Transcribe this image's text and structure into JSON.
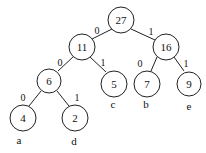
{
  "diagram": {
    "type": "huffman-tree",
    "nodes": [
      {
        "id": "n27",
        "value": "27",
        "x": 121,
        "y": 20
      },
      {
        "id": "n11",
        "value": "11",
        "x": 82,
        "y": 47
      },
      {
        "id": "n16",
        "value": "16",
        "x": 166,
        "y": 47
      },
      {
        "id": "n6",
        "value": "6",
        "x": 49,
        "y": 81
      },
      {
        "id": "n5",
        "value": "5",
        "x": 114,
        "y": 83,
        "leaf_label": "c"
      },
      {
        "id": "n7",
        "value": "7",
        "x": 147,
        "y": 83,
        "leaf_label": "b"
      },
      {
        "id": "n9",
        "value": "9",
        "x": 189,
        "y": 83,
        "leaf_label": "e"
      },
      {
        "id": "n4",
        "value": "4",
        "x": 23,
        "y": 118,
        "leaf_label": "a"
      },
      {
        "id": "n2",
        "value": "2",
        "x": 75,
        "y": 118,
        "leaf_label": "d"
      }
    ],
    "edges": [
      {
        "from": "n27",
        "to": "n11",
        "label": "0"
      },
      {
        "from": "n27",
        "to": "n16",
        "label": "1"
      },
      {
        "from": "n11",
        "to": "n6",
        "label": "0"
      },
      {
        "from": "n11",
        "to": "n5",
        "label": "1"
      },
      {
        "from": "n16",
        "to": "n7",
        "label": "0"
      },
      {
        "from": "n16",
        "to": "n9",
        "label": "1"
      },
      {
        "from": "n6",
        "to": "n4",
        "label": "0"
      },
      {
        "from": "n6",
        "to": "n2",
        "label": "1"
      }
    ],
    "leaf_labels": {
      "a": "a",
      "b": "b",
      "c": "c",
      "d": "d",
      "e": "e"
    }
  }
}
